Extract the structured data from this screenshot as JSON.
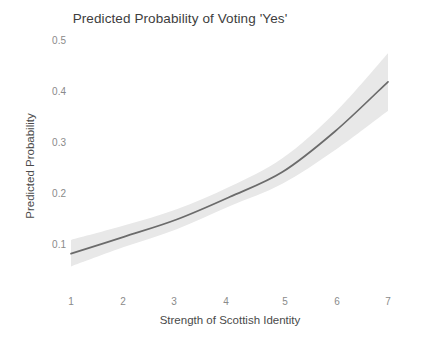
{
  "chart_data": {
    "type": "line",
    "title": "Predicted Probability of Voting 'Yes'",
    "xlabel": "Strength of Scottish Identity",
    "ylabel": "Predicted Probability",
    "x": [
      1,
      2,
      3,
      4,
      5,
      6,
      7
    ],
    "xticklabels": [
      "1",
      "2",
      "3",
      "4",
      "5",
      "6",
      "7"
    ],
    "yticklabels": [
      "0.1",
      "0.2",
      "0.3",
      "0.4",
      "0.5"
    ],
    "yticks": [
      0.1,
      0.2,
      0.3,
      0.4,
      0.5
    ],
    "xlim": [
      1,
      7
    ],
    "ylim": [
      0.04,
      0.5
    ],
    "grid": false,
    "legend": "none",
    "series": [
      {
        "name": "Predicted Probability",
        "values": [
          0.085,
          0.118,
          0.152,
          0.196,
          0.245,
          0.325,
          0.422
        ],
        "ci_lower": [
          0.06,
          0.098,
          0.133,
          0.178,
          0.222,
          0.288,
          0.365
        ],
        "ci_upper": [
          0.112,
          0.14,
          0.172,
          0.216,
          0.272,
          0.362,
          0.478
        ],
        "line_color": "#6b6b6b",
        "band_color": "#e8e8e8"
      }
    ]
  },
  "colors": {
    "background": "#ffffff",
    "line": "#6b6b6b",
    "band": "#e8e8e8",
    "tick_text": "#8a8a8a",
    "axis_title": "#4a4a4a",
    "title": "#3d3d3d"
  },
  "axis": {
    "y_tick_pixel_tops": [
      239,
      188,
      137,
      86,
      35
    ],
    "x_tick_pixel_lefts": [
      71,
      123,
      174,
      226,
      285,
      337,
      388
    ]
  }
}
